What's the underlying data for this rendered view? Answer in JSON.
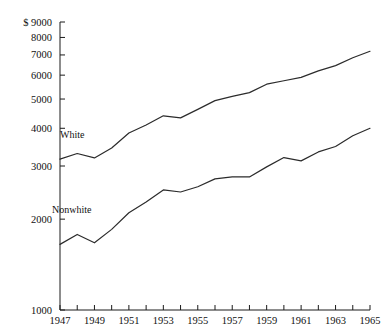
{
  "chart_data": {
    "type": "line",
    "title": "",
    "subtitle": "",
    "xlabel": "",
    "ylabel": "",
    "yscale": "log",
    "ylim": [
      1000,
      9000
    ],
    "xlim": [
      1947,
      1965
    ],
    "grid": false,
    "legend_position": "inline-labels",
    "currency_prefix": "$",
    "y_ticks": [
      9000,
      8000,
      7000,
      6000,
      5000,
      4000,
      3000,
      2000,
      1000
    ],
    "y_tick_labels": [
      "$ 9000",
      "8000",
      "7000",
      "6000",
      "5000",
      "4000",
      "3000",
      "2000",
      "1000"
    ],
    "x_ticks": [
      1947,
      1948,
      1949,
      1950,
      1951,
      1952,
      1953,
      1954,
      1955,
      1956,
      1957,
      1958,
      1959,
      1960,
      1961,
      1962,
      1963,
      1964,
      1965
    ],
    "x_tick_labels": [
      "1947",
      "",
      "1949",
      "",
      "1951",
      "",
      "1953",
      "",
      "1955",
      "",
      "1957",
      "",
      "1959",
      "",
      "1961",
      "",
      "1963",
      "",
      "1965"
    ],
    "x": [
      1947,
      1948,
      1949,
      1950,
      1951,
      1952,
      1953,
      1954,
      1955,
      1956,
      1957,
      1958,
      1959,
      1960,
      1961,
      1962,
      1963,
      1964,
      1965
    ],
    "series": [
      {
        "name": "White",
        "label": "White",
        "color": "#2b2b2b",
        "values": [
          3160,
          3300,
          3190,
          3440,
          3860,
          4100,
          4400,
          4330,
          4620,
          4940,
          5100,
          5250,
          5600,
          5750,
          5900,
          6200,
          6450,
          6850,
          7200
        ]
      },
      {
        "name": "Nonwhite",
        "label": "Nonwhite",
        "color": "#2b2b2b",
        "values": [
          1650,
          1780,
          1670,
          1850,
          2100,
          2280,
          2500,
          2460,
          2560,
          2720,
          2760,
          2760,
          2980,
          3200,
          3120,
          3340,
          3480,
          3780,
          4000
        ]
      }
    ]
  }
}
